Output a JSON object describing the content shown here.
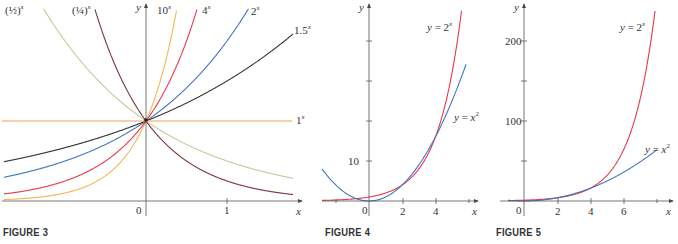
{
  "chart_data": [
    {
      "type": "line",
      "title": "FIGURE 3",
      "xlabel": "x",
      "ylabel": "y",
      "xticks": [
        {
          "value": 0,
          "label": "0"
        },
        {
          "value": 1,
          "label": "1"
        }
      ],
      "xlim": [
        -1.8,
        1.8
      ],
      "ylim": [
        0,
        2.45
      ],
      "grid": false,
      "series": [
        {
          "name": "(1/2)^x",
          "label": "(½)ˣ",
          "base": 0.5,
          "color": "#c9c79a"
        },
        {
          "name": "(1/4)^x",
          "label": "(¼)ˣ",
          "base": 0.25,
          "color": "#7a3344"
        },
        {
          "name": "10^x",
          "label": "10ˣ",
          "base": 10,
          "color": "#f2b84b"
        },
        {
          "name": "4^x",
          "label": "4ˣ",
          "base": 4,
          "color": "#e8394a"
        },
        {
          "name": "2^x",
          "label": "2ˣ",
          "base": 2,
          "color": "#3d74c4"
        },
        {
          "name": "1.5^x",
          "label": "1.5ˣ",
          "base": 1.5,
          "color": "#333333"
        },
        {
          "name": "1^x",
          "label": "1ˣ",
          "base": 1,
          "color": "#f0a05a"
        }
      ]
    },
    {
      "type": "line",
      "title": "FIGURE 4",
      "xlabel": "x",
      "ylabel": "y",
      "xticks": [
        {
          "value": 0,
          "label": "0"
        },
        {
          "value": 2,
          "label": "2"
        },
        {
          "value": 4,
          "label": "4"
        }
      ],
      "yticks": [
        {
          "value": 10,
          "label": "10"
        }
      ],
      "xlim": [
        -2.2,
        6
      ],
      "ylim": [
        0,
        40
      ],
      "grid": false,
      "series": [
        {
          "name": "y = 2^x",
          "label": "y = 2ˣ",
          "fn": "2^x",
          "color": "#e8394a"
        },
        {
          "name": "y = x^2",
          "label": "y = x²",
          "fn": "x^2",
          "color": "#3d74c4"
        }
      ]
    },
    {
      "type": "line",
      "title": "FIGURE 5",
      "xlabel": "x",
      "ylabel": "y",
      "xticks": [
        {
          "value": 0,
          "label": "0"
        },
        {
          "value": 2,
          "label": "2"
        },
        {
          "value": 4,
          "label": "4"
        },
        {
          "value": 6,
          "label": "6"
        }
      ],
      "yticks": [
        {
          "value": 100,
          "label": "100"
        },
        {
          "value": 200,
          "label": "200"
        }
      ],
      "xlim": [
        -1.5,
        8
      ],
      "ylim": [
        0,
        240
      ],
      "grid": false,
      "series": [
        {
          "name": "y = 2^x",
          "label": "y = 2ˣ",
          "fn": "2^x",
          "color": "#e8394a"
        },
        {
          "name": "y = x^2",
          "label": "y = x²",
          "fn": "x^2",
          "color": "#3d74c4"
        }
      ]
    }
  ],
  "figures": {
    "fig3": {
      "caption": "FIGURE 3",
      "x_axis": "x",
      "y_axis": "y",
      "tick_0": "0",
      "tick_1": "1",
      "labels": {
        "half": "(½)",
        "quarter": "(¼)",
        "ten": "10",
        "four": "4",
        "two": "2",
        "one_five": "1.5",
        "one": "1",
        "exp": "x"
      }
    },
    "fig4": {
      "caption": "FIGURE 4",
      "x_axis": "x",
      "y_axis": "y",
      "tick_0": "0",
      "tick_2": "2",
      "tick_4": "4",
      "tick_10": "10",
      "label_exp": "y = 2",
      "label_sq": "y = x",
      "sup_x": "x",
      "sup_2": "2"
    },
    "fig5": {
      "caption": "FIGURE 5",
      "x_axis": "x",
      "y_axis": "y",
      "tick_0": "0",
      "tick_2": "2",
      "tick_4": "4",
      "tick_6": "6",
      "tick_100": "100",
      "tick_200": "200",
      "label_exp": "y = 2",
      "label_sq": "y = x",
      "sup_x": "x",
      "sup_2": "2"
    }
  }
}
